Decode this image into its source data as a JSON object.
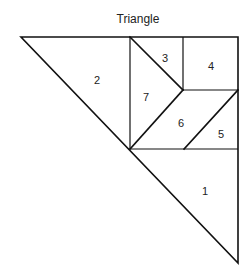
{
  "diagram": {
    "title": "Triangle",
    "pieces": [
      {
        "id": "1",
        "label": "1",
        "label_pos": [
          205,
          191
        ]
      },
      {
        "id": "2",
        "label": "2",
        "label_pos": [
          97,
          80
        ]
      },
      {
        "id": "3",
        "label": "3",
        "label_pos": [
          165,
          58
        ]
      },
      {
        "id": "4",
        "label": "4",
        "label_pos": [
          211,
          66
        ]
      },
      {
        "id": "5",
        "label": "5",
        "label_pos": [
          221,
          134
        ]
      },
      {
        "id": "6",
        "label": "6",
        "label_pos": [
          181,
          123
        ]
      },
      {
        "id": "7",
        "label": "7",
        "label_pos": [
          146,
          97
        ]
      }
    ],
    "colors": {
      "stroke": "#111111",
      "text": "#222222",
      "background": "#ffffff"
    }
  }
}
